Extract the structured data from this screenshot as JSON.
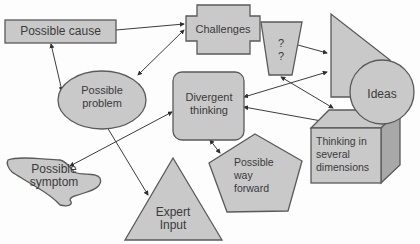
{
  "diagram": {
    "nodes": {
      "possible_cause": {
        "label": "Possible cause",
        "shape": "rectangle"
      },
      "challenges": {
        "label": "Challenges",
        "shape": "cross"
      },
      "question": {
        "label": "?\n?",
        "shape": "trapezoid"
      },
      "triangle_right": {
        "label": "",
        "shape": "right-triangle"
      },
      "ideas": {
        "label": "Ideas",
        "shape": "circle"
      },
      "possible_problem": {
        "label": "Possible\nproblem",
        "shape": "ellipse"
      },
      "divergent_thinking": {
        "label": "Divergent\nthinking",
        "shape": "rounded-rectangle"
      },
      "thinking_dimensions": {
        "label": "Thinking in\nseveral\ndimensions",
        "shape": "cube"
      },
      "possible_symptom": {
        "label": "Possible\nsymptom",
        "shape": "freeform"
      },
      "possible_way_forward": {
        "label": "Possible\nway\nforward",
        "shape": "pentagon"
      },
      "expert_input": {
        "label": "Expert\nInput",
        "shape": "triangle"
      }
    },
    "edges": [
      {
        "from": "possible_cause",
        "to": "challenges"
      },
      {
        "from": "possible_cause",
        "to": "possible_problem"
      },
      {
        "from": "possible_problem",
        "to": "challenges"
      },
      {
        "from": "possible_problem",
        "to": "expert_input"
      },
      {
        "from": "question",
        "to": "triangle_right"
      },
      {
        "from": "question",
        "to": "thinking_dimensions"
      },
      {
        "from": "divergent_thinking",
        "to": "triangle_right"
      },
      {
        "from": "divergent_thinking",
        "to": "thinking_dimensions"
      },
      {
        "from": "divergent_thinking",
        "to": "possible_symptom"
      },
      {
        "from": "divergent_thinking",
        "to": "possible_way_forward"
      },
      {
        "from": "thinking_dimensions",
        "to": "ideas"
      }
    ],
    "colors": {
      "fill": "#c9c9c9",
      "stroke": "#5a5a5a",
      "shade": "#a8a8a8",
      "text": "#3a3a3a"
    }
  }
}
